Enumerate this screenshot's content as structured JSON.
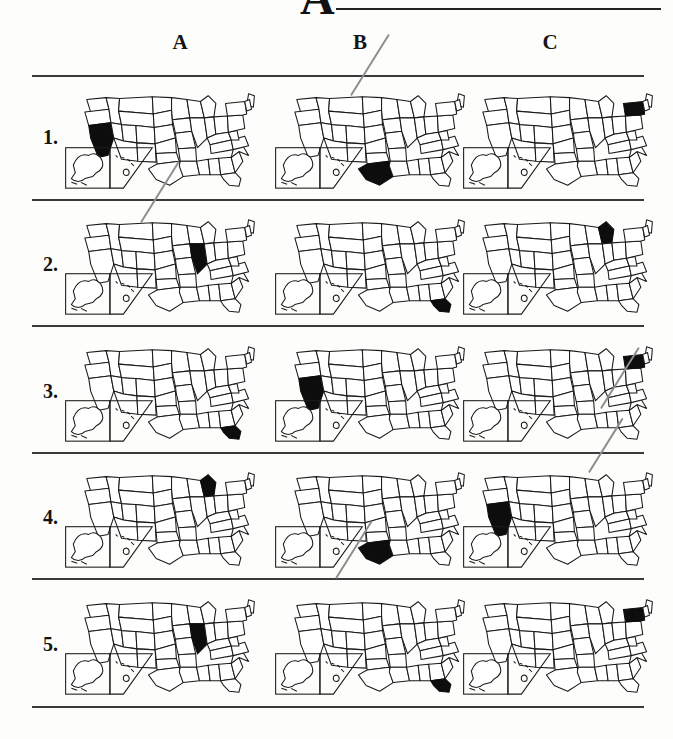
{
  "header": {
    "cut_off_letter": "A",
    "rule_present": true
  },
  "columns": [
    {
      "label": "A"
    },
    {
      "label": "B"
    },
    {
      "label": "C"
    }
  ],
  "rows": [
    {
      "label": "1.",
      "cells": [
        {
          "column": "A",
          "highlighted_state": "California",
          "state_code": "CA"
        },
        {
          "column": "B",
          "highlighted_state": "Texas",
          "state_code": "TX"
        },
        {
          "column": "C",
          "highlighted_state": "New York",
          "state_code": "NY"
        }
      ]
    },
    {
      "label": "2.",
      "cells": [
        {
          "column": "A",
          "highlighted_state": "Illinois",
          "state_code": "IL"
        },
        {
          "column": "B",
          "highlighted_state": "Florida",
          "state_code": "FL"
        },
        {
          "column": "C",
          "highlighted_state": "Michigan",
          "state_code": "MI"
        }
      ]
    },
    {
      "label": "3.",
      "cells": [
        {
          "column": "A",
          "highlighted_state": "Florida",
          "state_code": "FL"
        },
        {
          "column": "B",
          "highlighted_state": "California",
          "state_code": "CA"
        },
        {
          "column": "C",
          "highlighted_state": "New York",
          "state_code": "NY"
        }
      ]
    },
    {
      "label": "4.",
      "cells": [
        {
          "column": "A",
          "highlighted_state": "Michigan",
          "state_code": "MI"
        },
        {
          "column": "B",
          "highlighted_state": "Texas",
          "state_code": "TX"
        },
        {
          "column": "C",
          "highlighted_state": "California",
          "state_code": "CA"
        }
      ]
    },
    {
      "label": "5.",
      "cells": [
        {
          "column": "A",
          "highlighted_state": "Illinois",
          "state_code": "IL"
        },
        {
          "column": "B",
          "highlighted_state": "Florida",
          "state_code": "FL"
        },
        {
          "column": "C",
          "highlighted_state": "New York",
          "state_code": "NY"
        }
      ]
    }
  ],
  "pencil_marks": [
    {
      "id": "mark-1",
      "from": "row1-colB",
      "to": "row1-header"
    },
    {
      "id": "mark-2",
      "from": "row2-colA",
      "to": "row1-colA"
    },
    {
      "id": "mark-3",
      "from": "row3-colC",
      "to": "row3-header"
    },
    {
      "id": "mark-4",
      "from": "row4-colC",
      "to": "row3-colC"
    },
    {
      "id": "mark-5",
      "from": "row5-colB",
      "to": "row4-colB"
    }
  ],
  "colors": {
    "ink": "#1a1a1a",
    "highlight": "#0d0d0d",
    "rule": "#3a3a3a",
    "pencil": "#8e8e8e",
    "paper": "#fdfdfb"
  }
}
